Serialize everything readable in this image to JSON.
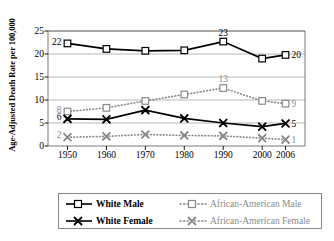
{
  "chart_data": {
    "type": "line",
    "title": "",
    "xlabel": "",
    "ylabel": "Age-Adjusted Death Rate per 100,000",
    "x": [
      1950,
      1960,
      1970,
      1980,
      1990,
      2000,
      2006
    ],
    "categories": [
      "1950",
      "1960",
      "1970",
      "1980",
      "1990",
      "2000",
      "2006"
    ],
    "xlim": [
      1945,
      2011
    ],
    "ylim": [
      0,
      25
    ],
    "yticks": [
      0,
      5,
      10,
      15,
      20,
      25
    ],
    "grid": true,
    "legend_position": "bottom",
    "series": [
      {
        "name": "White Male",
        "color": "#000000",
        "linestyle": "solid",
        "marker": "open-square",
        "values": [
          22.3,
          21.1,
          20.7,
          20.8,
          22.7,
          19.0,
          19.8
        ],
        "start_label": "22",
        "peak_label": "23",
        "peak_label_x": 1990,
        "end_label": "20"
      },
      {
        "name": "African-American Male",
        "color": "#8a8a8a",
        "linestyle": "dotted",
        "marker": "open-square",
        "values": [
          7.5,
          8.3,
          9.8,
          11.2,
          12.6,
          9.8,
          9.2
        ],
        "start_label": "8",
        "peak_label": "13",
        "peak_label_x": 1990,
        "end_label": "9"
      },
      {
        "name": "White Female",
        "color": "#000000",
        "linestyle": "solid",
        "marker": "x-cross",
        "values": [
          5.9,
          5.8,
          7.8,
          6.0,
          5.0,
          4.2,
          4.9
        ],
        "start_label": "6",
        "peak_label": "",
        "end_label": "5"
      },
      {
        "name": "African-American Female",
        "color": "#8a8a8a",
        "linestyle": "dotted",
        "marker": "x-cross",
        "values": [
          1.9,
          2.1,
          2.5,
          2.3,
          2.2,
          1.7,
          1.4
        ],
        "start_label": "2",
        "peak_label": "",
        "end_label": "1"
      }
    ]
  },
  "legend": {
    "items": [
      {
        "label": "White Male",
        "style": "black"
      },
      {
        "label": "African-American Male",
        "style": "gray"
      },
      {
        "label": "White Female",
        "style": "black"
      },
      {
        "label": "African-American Female",
        "style": "gray"
      }
    ]
  }
}
